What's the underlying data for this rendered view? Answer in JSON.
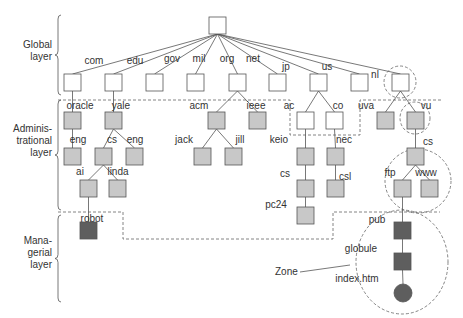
{
  "layers": [
    {
      "id": "global",
      "lines": [
        "Global",
        "layer"
      ],
      "x": 38,
      "y": 50,
      "brace": {
        "x": 58,
        "y1": 15,
        "y2": 95
      }
    },
    {
      "id": "admin",
      "lines": [
        "Adminis-",
        "trational",
        "layer"
      ],
      "x": 38,
      "y": 140,
      "brace": {
        "x": 58,
        "y1": 100,
        "y2": 210
      }
    },
    {
      "id": "managerial",
      "lines": [
        "Mana-",
        "gerial",
        "layer"
      ],
      "x": 38,
      "y": 252,
      "brace": {
        "x": 58,
        "y1": 215,
        "y2": 302
      }
    }
  ],
  "colors": {
    "white": "#ffffff",
    "gray": "#c8c8c8",
    "dark": "#5e5e5e",
    "stroke": "#555555"
  },
  "nodes": [
    {
      "id": "root",
      "x": 209,
      "y": 17,
      "fill": "white"
    },
    {
      "id": "com",
      "x": 64,
      "y": 74,
      "fill": "white"
    },
    {
      "id": "edu",
      "x": 105,
      "y": 74,
      "fill": "white"
    },
    {
      "id": "gov",
      "x": 146,
      "y": 74,
      "fill": "white"
    },
    {
      "id": "mil",
      "x": 187,
      "y": 74,
      "fill": "white"
    },
    {
      "id": "org",
      "x": 229,
      "y": 74,
      "fill": "white"
    },
    {
      "id": "net",
      "x": 269,
      "y": 74,
      "fill": "white"
    },
    {
      "id": "jp",
      "x": 310,
      "y": 74,
      "fill": "white"
    },
    {
      "id": "us",
      "x": 351,
      "y": 74,
      "fill": "white"
    },
    {
      "id": "nl",
      "x": 392,
      "y": 74,
      "fill": "white"
    },
    {
      "id": "oracle",
      "x": 64,
      "y": 112,
      "fill": "gray"
    },
    {
      "id": "yale",
      "x": 105,
      "y": 112,
      "fill": "gray"
    },
    {
      "id": "acm",
      "x": 208,
      "y": 112,
      "fill": "gray"
    },
    {
      "id": "ieee",
      "x": 249,
      "y": 112,
      "fill": "gray"
    },
    {
      "id": "ac",
      "x": 297,
      "y": 112,
      "fill": "white"
    },
    {
      "id": "co",
      "x": 326,
      "y": 112,
      "fill": "white"
    },
    {
      "id": "uva",
      "x": 377,
      "y": 112,
      "fill": "gray"
    },
    {
      "id": "vu",
      "x": 407,
      "y": 112,
      "fill": "gray"
    },
    {
      "id": "oracle_eng",
      "x": 64,
      "y": 148,
      "fill": "gray"
    },
    {
      "id": "yale_cs",
      "x": 95,
      "y": 148,
      "fill": "gray"
    },
    {
      "id": "yale_eng",
      "x": 126,
      "y": 148,
      "fill": "gray"
    },
    {
      "id": "jack",
      "x": 194,
      "y": 148,
      "fill": "gray"
    },
    {
      "id": "jill",
      "x": 225,
      "y": 148,
      "fill": "gray"
    },
    {
      "id": "keio",
      "x": 297,
      "y": 148,
      "fill": "gray"
    },
    {
      "id": "nec",
      "x": 327,
      "y": 148,
      "fill": "gray"
    },
    {
      "id": "vu_cs",
      "x": 407,
      "y": 148,
      "fill": "gray"
    },
    {
      "id": "ai",
      "x": 80,
      "y": 180,
      "fill": "gray"
    },
    {
      "id": "linda",
      "x": 109,
      "y": 180,
      "fill": "gray"
    },
    {
      "id": "keio_cs",
      "x": 297,
      "y": 180,
      "fill": "gray"
    },
    {
      "id": "csl",
      "x": 327,
      "y": 180,
      "fill": "gray"
    },
    {
      "id": "ftp",
      "x": 394,
      "y": 180,
      "fill": "gray"
    },
    {
      "id": "www",
      "x": 421,
      "y": 180,
      "fill": "gray"
    },
    {
      "id": "pc24",
      "x": 297,
      "y": 207,
      "fill": "gray"
    },
    {
      "id": "robot",
      "x": 80,
      "y": 222,
      "fill": "dark"
    },
    {
      "id": "pub",
      "x": 394,
      "y": 222,
      "fill": "dark"
    },
    {
      "id": "globule",
      "x": 394,
      "y": 253,
      "fill": "dark"
    }
  ],
  "circle_node": {
    "id": "index.htm",
    "cx": 403,
    "cy": 293,
    "r": 9,
    "fill": "dark"
  },
  "edges": [
    [
      "root",
      "com"
    ],
    [
      "root",
      "edu"
    ],
    [
      "root",
      "gov"
    ],
    [
      "root",
      "mil"
    ],
    [
      "root",
      "org"
    ],
    [
      "root",
      "net"
    ],
    [
      "root",
      "jp"
    ],
    [
      "root",
      "us"
    ],
    [
      "root",
      "nl"
    ],
    [
      "com",
      "oracle"
    ],
    [
      "edu",
      "yale"
    ],
    [
      "org",
      "acm"
    ],
    [
      "org",
      "ieee"
    ],
    [
      "jp",
      "ac"
    ],
    [
      "jp",
      "co"
    ],
    [
      "nl",
      "uva"
    ],
    [
      "nl",
      "vu"
    ],
    [
      "oracle",
      "oracle_eng"
    ],
    [
      "yale",
      "yale_cs"
    ],
    [
      "yale",
      "yale_eng"
    ],
    [
      "acm",
      "jack"
    ],
    [
      "acm",
      "jill"
    ],
    [
      "ac",
      "keio"
    ],
    [
      "co",
      "nec"
    ],
    [
      "vu",
      "vu_cs"
    ],
    [
      "yale_cs",
      "ai"
    ],
    [
      "yale_cs",
      "linda"
    ],
    [
      "keio",
      "keio_cs"
    ],
    [
      "nec",
      "csl"
    ],
    [
      "vu_cs",
      "ftp"
    ],
    [
      "vu_cs",
      "www"
    ],
    [
      "keio_cs",
      "pc24"
    ],
    [
      "ai",
      "robot"
    ],
    [
      "ftp",
      "pub"
    ],
    [
      "pub",
      "globule"
    ],
    [
      "globule",
      "index.htm"
    ]
  ],
  "labels": [
    {
      "text": "com",
      "x": 94,
      "y": 64
    },
    {
      "text": "edu",
      "x": 135,
      "y": 64
    },
    {
      "text": "gov",
      "x": 172,
      "y": 62
    },
    {
      "text": "mil",
      "x": 199,
      "y": 62
    },
    {
      "text": "org",
      "x": 227,
      "y": 62
    },
    {
      "text": "net",
      "x": 253,
      "y": 62
    },
    {
      "text": "jp",
      "x": 286,
      "y": 70
    },
    {
      "text": "us",
      "x": 327,
      "y": 70
    },
    {
      "text": "nl",
      "x": 375,
      "y": 78
    },
    {
      "text": "oracle",
      "x": 80,
      "y": 109
    },
    {
      "text": "yale",
      "x": 121,
      "y": 109
    },
    {
      "text": "acm",
      "x": 199,
      "y": 109
    },
    {
      "text": "ieee",
      "x": 256,
      "y": 109
    },
    {
      "text": "ac",
      "x": 289,
      "y": 109
    },
    {
      "text": "co",
      "x": 338,
      "y": 109
    },
    {
      "text": "uva",
      "x": 366,
      "y": 109
    },
    {
      "text": "vu",
      "x": 426,
      "y": 109
    },
    {
      "text": "eng",
      "x": 78,
      "y": 143
    },
    {
      "text": "cs",
      "x": 112,
      "y": 143
    },
    {
      "text": "eng",
      "x": 135,
      "y": 143
    },
    {
      "text": "jack",
      "x": 184,
      "y": 143
    },
    {
      "text": "jill",
      "x": 240,
      "y": 143
    },
    {
      "text": "keio",
      "x": 279,
      "y": 143
    },
    {
      "text": "nec",
      "x": 344,
      "y": 143
    },
    {
      "text": "cs",
      "x": 428,
      "y": 145
    },
    {
      "text": "ai",
      "x": 80,
      "y": 175
    },
    {
      "text": "linda",
      "x": 118,
      "y": 175
    },
    {
      "text": "cs",
      "x": 285,
      "y": 177
    },
    {
      "text": "csl",
      "x": 345,
      "y": 180
    },
    {
      "text": "ftp",
      "x": 390,
      "y": 176
    },
    {
      "text": "www",
      "x": 426,
      "y": 176
    },
    {
      "text": "pc24",
      "x": 276,
      "y": 208
    },
    {
      "text": "robot",
      "x": 92,
      "y": 222
    },
    {
      "text": "pub",
      "x": 377,
      "y": 223
    },
    {
      "text": "globule",
      "x": 361,
      "y": 252
    },
    {
      "text": "index.htm",
      "x": 357,
      "y": 282
    }
  ],
  "zone": {
    "label": "Zone",
    "label_x": 275,
    "label_y": 275,
    "line": [
      300,
      272,
      350,
      265
    ]
  },
  "dashed_regions": [
    {
      "id": "admin-region",
      "points": "58,100 296,100 296,110 288,110 288,135 342,135 342,110 362,110 362,100 450,100 450,108 362,108"
    },
    {
      "id": "admin-left",
      "d": "M58,100 L290,100 L290,135 L360,135 L360,100 L442,100"
    },
    {
      "id": "managerial",
      "d": "M58,212 L123,212 L123,239 L333,239 L333,212 L440,212"
    }
  ],
  "dashed_circles": [
    {
      "id": "nl-circle",
      "cx": 400,
      "cy": 82,
      "rx": 16,
      "ry": 16
    },
    {
      "id": "vu-circle",
      "cx": 415,
      "cy": 118,
      "rx": 15,
      "ry": 16
    },
    {
      "id": "cs-zone-circle",
      "cx": 418,
      "cy": 181,
      "rx": 33,
      "ry": 32
    },
    {
      "id": "zone-circle",
      "cx": 402,
      "cy": 262,
      "rx": 46,
      "ry": 52
    }
  ]
}
